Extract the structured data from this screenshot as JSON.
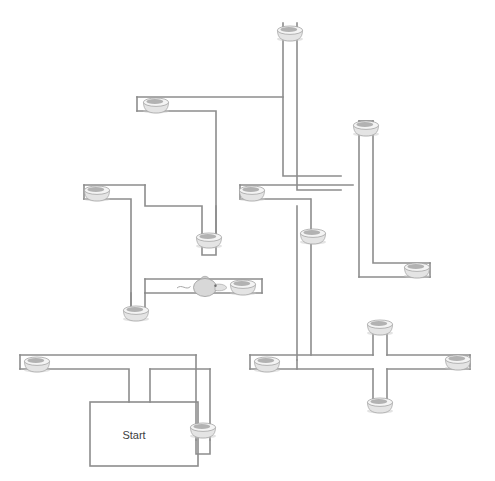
{
  "diagram": {
    "type": "radial-arm-maze",
    "start_label": "Start",
    "wall_color": "#8d8d8d",
    "background_color": "#ffffff",
    "bowl_color": "#e4e4e4",
    "mouse_color": "#d8d8d8",
    "corridor_width": 14,
    "canvas": {
      "width": 495,
      "height": 481
    }
  },
  "start_chamber": {
    "label": "Start",
    "x": 90,
    "y": 402,
    "width": 108,
    "height": 64,
    "label_x": 134,
    "label_y": 436
  },
  "corridors": [
    {
      "name": "top-vertical-arm",
      "path": "M 283 23 L 283 176 L 341 176"
    },
    {
      "name": "top-vertical-arm-right",
      "path": "M 297 23 L 297 190 L 341 190"
    },
    {
      "name": "upper-left-arm-top",
      "path": "M 137 97 L 283 97"
    },
    {
      "name": "upper-left-arm-bottom",
      "path": "M 137 111 L 216 111 L 216 241"
    },
    {
      "name": "upper-left-arm-left-wall",
      "path": "M 137 97 L 137 111"
    },
    {
      "name": "right-upper-vertical-top",
      "path": "M 359 121 L 359 277"
    },
    {
      "name": "right-upper-vertical-right",
      "path": "M 373 121 L 373 263 L 430 263"
    },
    {
      "name": "right-upper-cap",
      "path": "M 359 121 L 373 121"
    },
    {
      "name": "right-upper-branch-bottom",
      "path": "M 359 277 L 430 277"
    },
    {
      "name": "right-upper-branch-right",
      "path": "M 430 263 L 430 277"
    },
    {
      "name": "mid-left-arm-top",
      "path": "M 84 185 L 145 185"
    },
    {
      "name": "mid-left-arm-bottom",
      "path": "M 84 199 L 131 199 L 131 312"
    },
    {
      "name": "mid-left-arm-left-cap",
      "path": "M 84 185 L 84 199"
    },
    {
      "name": "mid-center-vertical-left",
      "path": "M 145 185 L 145 206 L 202 206 L 202 241"
    },
    {
      "name": "mid-center-vertical-right",
      "path": "M 216 241 L 216 206"
    },
    {
      "name": "mid-right-arm-top",
      "path": "M 240 185 L 353 185"
    },
    {
      "name": "mid-right-arm-bottom",
      "path": "M 240 199 L 310 199"
    },
    {
      "name": "mid-right-arm-left-cap",
      "path": "M 240 185 L 240 199"
    },
    {
      "name": "center-bowl-cap-left",
      "path": "M 202 241 L 202 255 L 216 255 L 216 241"
    },
    {
      "name": "mouse-corridor-top",
      "path": "M 145 279 L 262 279"
    },
    {
      "name": "mouse-corridor-bottom",
      "path": "M 145 293 L 262 293"
    },
    {
      "name": "mouse-corridor-right-cap",
      "path": "M 262 279 L 262 293"
    },
    {
      "name": "mouse-corridor-left-down",
      "path": "M 145 279 L 145 293"
    },
    {
      "name": "left-lower-vertical",
      "path": "M 131 293 L 131 312 L 145 312 L 145 293"
    },
    {
      "name": "center-vertical-long-left",
      "path": "M 297 206 L 297 360"
    },
    {
      "name": "center-vertical-long-right",
      "path": "M 311 199 L 311 238"
    },
    {
      "name": "bottom-left-arm-top",
      "path": "M 20 355 L 196 355"
    },
    {
      "name": "bottom-left-arm-bottom",
      "path": "M 20 369 L 129 369 L 129 402"
    },
    {
      "name": "bottom-left-arm-left-cap",
      "path": "M 20 355 L 20 369"
    },
    {
      "name": "bottom-center-vertical-left",
      "path": "M 150 369 L 150 402"
    },
    {
      "name": "bottom-center-vertical-right",
      "path": "M 196 355 L 196 440"
    },
    {
      "name": "bottom-center-vertical-right2",
      "path": "M 210 369 L 210 440"
    },
    {
      "name": "bottom-mid-horizontal",
      "path": "M 150 369 L 210 369"
    },
    {
      "name": "bottom-center-bowl-cap",
      "path": "M 196 440 L 196 454 L 210 454 L 210 440"
    },
    {
      "name": "right-lower-horizontal-top",
      "path": "M 250 355 L 373 355"
    },
    {
      "name": "right-lower-horizontal-bottom",
      "path": "M 250 369 L 373 369"
    },
    {
      "name": "right-lower-left-cap",
      "path": "M 250 355 L 250 369"
    },
    {
      "name": "right-cross-horizontal-top",
      "path": "M 387 355 L 470 355"
    },
    {
      "name": "right-cross-horizontal-bottom",
      "path": "M 387 369 L 470 369"
    },
    {
      "name": "right-cross-right-cap",
      "path": "M 470 355 L 470 369"
    },
    {
      "name": "right-cross-vertical-up-left",
      "path": "M 373 355 L 373 325"
    },
    {
      "name": "right-cross-vertical-up-right",
      "path": "M 387 355 L 387 325"
    },
    {
      "name": "right-cross-top-cap",
      "path": "M 373 325 L 387 325"
    },
    {
      "name": "right-cross-vertical-down-left",
      "path": "M 373 369 L 373 400"
    },
    {
      "name": "right-cross-vertical-down-right",
      "path": "M 387 369 L 387 400"
    },
    {
      "name": "right-cross-bottom-cap",
      "path": "M 373 400 L 387 400"
    },
    {
      "name": "right-branch-up",
      "path": "M 311 238 L 311 355"
    },
    {
      "name": "right-mid-connector",
      "path": "M 297 360 L 297 369"
    }
  ],
  "bowls": [
    {
      "name": "bowl-top-arm",
      "x": 290,
      "y": 33,
      "orientation": "horizontal"
    },
    {
      "name": "bowl-upper-left",
      "x": 156,
      "y": 105,
      "orientation": "horizontal"
    },
    {
      "name": "bowl-right-upper",
      "x": 366,
      "y": 128,
      "orientation": "horizontal"
    },
    {
      "name": "bowl-mid-left",
      "x": 97,
      "y": 193,
      "orientation": "horizontal"
    },
    {
      "name": "bowl-mid-right",
      "x": 252,
      "y": 193,
      "orientation": "horizontal"
    },
    {
      "name": "bowl-center",
      "x": 209,
      "y": 240,
      "orientation": "horizontal"
    },
    {
      "name": "bowl-right-branch",
      "x": 313,
      "y": 236,
      "orientation": "horizontal"
    },
    {
      "name": "bowl-right-east",
      "x": 417,
      "y": 270,
      "orientation": "horizontal"
    },
    {
      "name": "bowl-mouse-corridor",
      "x": 243,
      "y": 287,
      "orientation": "horizontal"
    },
    {
      "name": "bowl-left-lower",
      "x": 136,
      "y": 313,
      "orientation": "horizontal"
    },
    {
      "name": "bowl-cross-top",
      "x": 380,
      "y": 327,
      "orientation": "horizontal"
    },
    {
      "name": "bowl-bottom-left",
      "x": 37,
      "y": 364,
      "orientation": "horizontal"
    },
    {
      "name": "bowl-right-lower-left",
      "x": 267,
      "y": 364,
      "orientation": "horizontal"
    },
    {
      "name": "bowl-cross-right",
      "x": 458,
      "y": 362,
      "orientation": "horizontal"
    },
    {
      "name": "bowl-cross-bottom",
      "x": 380,
      "y": 405,
      "orientation": "horizontal"
    },
    {
      "name": "bowl-bottom-center",
      "x": 203,
      "y": 430,
      "orientation": "horizontal"
    }
  ],
  "mouse": {
    "name": "mouse-figure",
    "x": 208,
    "y": 287,
    "facing": "right"
  }
}
